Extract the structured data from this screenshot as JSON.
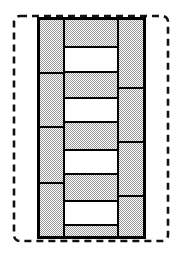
{
  "figure": {
    "title": "Masonry Bond Section Diagram",
    "background_color": "#ffffff",
    "line_color": "#000000"
  },
  "boundary": {
    "name": "dashed-outline",
    "shape": "rounded-rectangle",
    "x": 14,
    "y": 16,
    "width": 154,
    "height": 225,
    "corner_radius": 6,
    "stroke_color": "#111111",
    "stroke_width": 2.6,
    "dash_pattern": "7 5",
    "fill": "none"
  },
  "hatch": {
    "name": "stipple-fill",
    "type": "dither-checker",
    "dot_color": "#9a9a9a",
    "base_color": "#ffffff",
    "cell_size": 2,
    "average_tone": "#d8d8d8"
  },
  "stroke": {
    "outline_color": "#000000",
    "block_stroke_width": 2.4,
    "joint_stroke_width": 2.4
  },
  "columns": [
    {
      "name": "left-leaf",
      "index": 0,
      "x": 38,
      "width": 26,
      "y_top": 18,
      "y_bottom": 238,
      "fill": "hatched",
      "block_count": 4,
      "joint_positions": [
        73,
        127,
        183
      ],
      "blocks": [
        {
          "label": "L1",
          "y": 18,
          "height": 55
        },
        {
          "label": "L2",
          "y": 73,
          "height": 54
        },
        {
          "label": "L3",
          "y": 127,
          "height": 56
        },
        {
          "label": "L4",
          "y": 183,
          "height": 55
        }
      ]
    },
    {
      "name": "center-leaf",
      "index": 1,
      "x": 64,
      "width": 54,
      "y_top": 18,
      "y_bottom": 238,
      "fill": "alternating",
      "block_count": 9,
      "blocks": [
        {
          "label": "C1",
          "y": 18,
          "height": 29,
          "fill": "hatched"
        },
        {
          "label": "C2",
          "y": 47,
          "height": 25,
          "fill": "open"
        },
        {
          "label": "C3",
          "y": 72,
          "height": 26,
          "fill": "hatched"
        },
        {
          "label": "C4",
          "y": 98,
          "height": 24,
          "fill": "open"
        },
        {
          "label": "C5",
          "y": 122,
          "height": 28,
          "fill": "hatched"
        },
        {
          "label": "C6",
          "y": 150,
          "height": 24,
          "fill": "open"
        },
        {
          "label": "C7",
          "y": 174,
          "height": 27,
          "fill": "hatched"
        },
        {
          "label": "C8",
          "y": 201,
          "height": 24,
          "fill": "open"
        },
        {
          "label": "C9",
          "y": 225,
          "height": 13,
          "fill": "hatched"
        }
      ]
    },
    {
      "name": "right-leaf",
      "index": 2,
      "x": 118,
      "width": 27,
      "y_top": 18,
      "y_bottom": 238,
      "fill": "hatched",
      "block_count": 4,
      "joint_positions": [
        88,
        142,
        196
      ],
      "blocks": [
        {
          "label": "R1",
          "y": 18,
          "height": 70
        },
        {
          "label": "R2",
          "y": 88,
          "height": 54
        },
        {
          "label": "R3",
          "y": 142,
          "height": 54
        },
        {
          "label": "R4",
          "y": 196,
          "height": 42
        }
      ]
    }
  ],
  "legend": {
    "hatched_meaning": "solid masonry unit",
    "open_meaning": "void / open joint"
  }
}
